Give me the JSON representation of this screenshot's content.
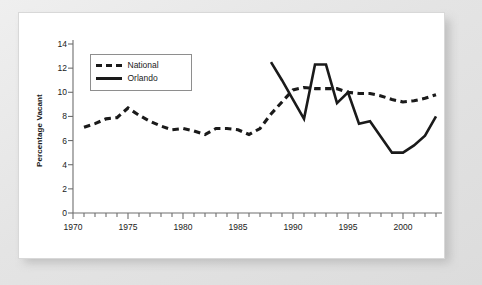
{
  "chart_data": {
    "type": "line",
    "title": "",
    "xlabel": "",
    "ylabel": "Percentage Vacant",
    "xlim": [
      1970,
      2003
    ],
    "ylim": [
      0,
      14
    ],
    "yticks": [
      0,
      2,
      4,
      6,
      8,
      10,
      12,
      14
    ],
    "xticks": [
      1970,
      1975,
      1980,
      1985,
      1990,
      1995,
      2000
    ],
    "xtick_minor_step": 1,
    "grid": false,
    "legend_position": "upper-left",
    "series": [
      {
        "name": "National",
        "style": "dashed",
        "color": "#1a1a1a",
        "x": [
          1971,
          1972,
          1973,
          1974,
          1975,
          1976,
          1977,
          1978,
          1979,
          1980,
          1981,
          1982,
          1983,
          1984,
          1985,
          1986,
          1987,
          1988,
          1989,
          1990,
          1991,
          1992,
          1993,
          1994,
          1995,
          1996,
          1997,
          1998,
          1999,
          2000,
          2001,
          2002,
          2003
        ],
        "values": [
          7.1,
          7.4,
          7.8,
          7.9,
          8.7,
          8.1,
          7.6,
          7.2,
          6.9,
          7.0,
          6.8,
          6.5,
          7.0,
          7.0,
          6.9,
          6.5,
          7.0,
          8.2,
          9.2,
          10.2,
          10.4,
          10.3,
          10.3,
          10.3,
          10.0,
          9.9,
          9.9,
          9.7,
          9.4,
          9.2,
          9.3,
          9.5,
          9.8
        ]
      },
      {
        "name": "Orlando",
        "style": "solid",
        "color": "#1a1a1a",
        "x": [
          1988,
          1989,
          1990,
          1991,
          1992,
          1993,
          1994,
          1995,
          1996,
          1997,
          1998,
          1999,
          2000,
          2001,
          2002,
          2003
        ],
        "values": [
          12.5,
          11.0,
          9.4,
          7.8,
          12.3,
          12.3,
          9.1,
          10.0,
          7.4,
          7.6,
          6.3,
          5.0,
          5.0,
          5.6,
          6.4,
          8.0
        ]
      }
    ]
  },
  "axis": {
    "y_title": "Percentage Vacant",
    "y_labels": [
      "14",
      "12",
      "10",
      "8",
      "6",
      "4",
      "2",
      "0"
    ],
    "x_labels": [
      "1970",
      "1975",
      "1980",
      "1985",
      "1990",
      "1995",
      "2000"
    ]
  },
  "legend": {
    "entries": [
      {
        "label": "National",
        "style": "dashed"
      },
      {
        "label": "Orlando",
        "style": "solid"
      }
    ]
  }
}
